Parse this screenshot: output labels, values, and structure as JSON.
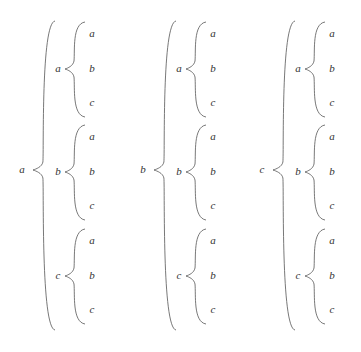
{
  "diagram": {
    "type": "nested-brace-tree",
    "colors": {
      "ink": "#333333",
      "brace": "#555555",
      "background": "#ffffff"
    },
    "columns": [
      {
        "label": "a",
        "children": [
          {
            "label": "a",
            "leaves": [
              "a",
              "b",
              "c"
            ]
          },
          {
            "label": "b",
            "leaves": [
              "a",
              "b",
              "c"
            ]
          },
          {
            "label": "c",
            "leaves": [
              "a",
              "b",
              "c"
            ]
          }
        ]
      },
      {
        "label": "b",
        "children": [
          {
            "label": "a",
            "leaves": [
              "a",
              "b",
              "c"
            ]
          },
          {
            "label": "b",
            "leaves": [
              "a",
              "b",
              "c"
            ]
          },
          {
            "label": "c",
            "leaves": [
              "a",
              "b",
              "c"
            ]
          }
        ]
      },
      {
        "label": "c",
        "children": [
          {
            "label": "a",
            "leaves": [
              "a",
              "b",
              "c"
            ]
          },
          {
            "label": "b",
            "leaves": [
              "a",
              "b",
              "c"
            ]
          },
          {
            "label": "c",
            "leaves": [
              "a",
              "b",
              "c"
            ]
          }
        ]
      }
    ]
  }
}
